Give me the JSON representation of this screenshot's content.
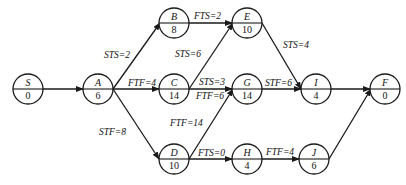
{
  "diagram": {
    "type": "precedence-network",
    "nodes": [
      {
        "id": "S",
        "label": "S",
        "duration": "0",
        "x": 28,
        "y": 89
      },
      {
        "id": "A",
        "label": "A",
        "duration": "6",
        "x": 98,
        "y": 89
      },
      {
        "id": "B",
        "label": "B",
        "duration": "8",
        "x": 174,
        "y": 23
      },
      {
        "id": "C",
        "label": "C",
        "duration": "14",
        "x": 174,
        "y": 89
      },
      {
        "id": "D",
        "label": "D",
        "duration": "10",
        "x": 174,
        "y": 159
      },
      {
        "id": "E",
        "label": "E",
        "duration": "10",
        "x": 247,
        "y": 23
      },
      {
        "id": "G",
        "label": "G",
        "duration": "14",
        "x": 247,
        "y": 89
      },
      {
        "id": "H",
        "label": "H",
        "duration": "4",
        "x": 247,
        "y": 159
      },
      {
        "id": "I",
        "label": "I",
        "duration": "4",
        "x": 316,
        "y": 89
      },
      {
        "id": "J",
        "label": "J",
        "duration": "6",
        "x": 314,
        "y": 159
      },
      {
        "id": "F",
        "label": "F",
        "duration": "0",
        "x": 385,
        "y": 89
      }
    ],
    "edges": [
      {
        "from": "S",
        "to": "A",
        "label": ""
      },
      {
        "from": "A",
        "to": "B",
        "label": "STS=2"
      },
      {
        "from": "A",
        "to": "C",
        "label": "FTF=4"
      },
      {
        "from": "A",
        "to": "D",
        "label": "STF=8"
      },
      {
        "from": "B",
        "to": "E",
        "label": "FTS=2"
      },
      {
        "from": "C",
        "to": "E",
        "label": "STS=6"
      },
      {
        "from": "C",
        "to": "G",
        "label": "STS=3"
      },
      {
        "from": "C",
        "to": "G",
        "label": "FTF=6"
      },
      {
        "from": "D",
        "to": "G",
        "label": "FTF=14"
      },
      {
        "from": "D",
        "to": "H",
        "label": "FTS=0"
      },
      {
        "from": "E",
        "to": "I",
        "label": "STS=4"
      },
      {
        "from": "G",
        "to": "I",
        "label": "STF=6"
      },
      {
        "from": "H",
        "to": "J",
        "label": "FTF=4"
      },
      {
        "from": "I",
        "to": "F",
        "label": ""
      },
      {
        "from": "J",
        "to": "F",
        "label": ""
      }
    ],
    "labels": {
      "AB": "STS=2",
      "AC": "FTF=4",
      "AD": "STF=8",
      "BE": "FTS=2",
      "CE": "STS=6",
      "CG_sts": "STS=3",
      "CG_ftf": "FTF=6",
      "DG": "FTF=14",
      "DH": "FTS=0",
      "EI": "STS=4",
      "GI": "STF=6",
      "HJ": "FTF=4"
    },
    "node_text": {
      "S": {
        "name": "S",
        "dur": "0"
      },
      "A": {
        "name": "A",
        "dur": "6"
      },
      "B": {
        "name": "B",
        "dur": "8"
      },
      "C": {
        "name": "C",
        "dur": "14"
      },
      "D": {
        "name": "D",
        "dur": "10"
      },
      "E": {
        "name": "E",
        "dur": "10"
      },
      "G": {
        "name": "G",
        "dur": "14"
      },
      "H": {
        "name": "H",
        "dur": "4"
      },
      "I": {
        "name": "I",
        "dur": "4"
      },
      "J": {
        "name": "J",
        "dur": "6"
      },
      "F": {
        "name": "F",
        "dur": "0"
      }
    }
  }
}
